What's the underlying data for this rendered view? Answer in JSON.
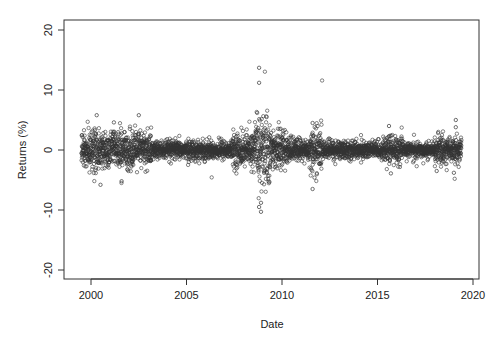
{
  "chart_data": {
    "type": "scatter",
    "title": "",
    "xlabel": "Date",
    "ylabel": "Returns (%)",
    "xlim": [
      1998.6,
      2020.3
    ],
    "ylim": [
      -22,
      22
    ],
    "x_ticks": [
      2000,
      2005,
      2010,
      2015,
      2020
    ],
    "x_tick_labels": [
      "2000",
      "2005",
      "2010",
      "2015",
      "2020"
    ],
    "y_ticks": [
      -20,
      -10,
      0,
      10,
      20
    ],
    "y_tick_labels": [
      "-20",
      "-10",
      "0",
      "10",
      "20"
    ],
    "grid": false,
    "legend": null,
    "marker": "open-circle",
    "marker_color": "#333333",
    "date_range": [
      1999.5,
      2019.4
    ],
    "volatility_regimes": [
      {
        "from": 1999.5,
        "to": 2003.2,
        "sd": 1.5
      },
      {
        "from": 2003.2,
        "to": 2007.4,
        "sd": 0.75
      },
      {
        "from": 2007.4,
        "to": 2008.6,
        "sd": 1.3
      },
      {
        "from": 2008.6,
        "to": 2009.4,
        "sd": 3.2
      },
      {
        "from": 2009.4,
        "to": 2010.3,
        "sd": 1.4
      },
      {
        "from": 2010.3,
        "to": 2011.5,
        "sd": 0.95
      },
      {
        "from": 2011.5,
        "to": 2012.1,
        "sd": 1.7
      },
      {
        "from": 2012.1,
        "to": 2015.5,
        "sd": 0.75
      },
      {
        "from": 2015.5,
        "to": 2016.3,
        "sd": 1.2
      },
      {
        "from": 2016.3,
        "to": 2018.0,
        "sd": 0.55
      },
      {
        "from": 2018.0,
        "to": 2019.4,
        "sd": 1.1
      }
    ],
    "notable_points": [
      {
        "x": 2008.8,
        "y": 13.7
      },
      {
        "x": 2008.8,
        "y": 11.2
      },
      {
        "x": 2008.9,
        "y": -10.3
      },
      {
        "x": 2008.8,
        "y": -9.5
      },
      {
        "x": 2008.9,
        "y": -8.8
      },
      {
        "x": 2000.3,
        "y": 5.8
      },
      {
        "x": 2000.5,
        "y": -5.8
      },
      {
        "x": 2001.6,
        "y": -5.2
      },
      {
        "x": 2002.5,
        "y": 5.8
      },
      {
        "x": 2001.2,
        "y": 4.6
      },
      {
        "x": 2011.6,
        "y": 4.5
      },
      {
        "x": 2011.6,
        "y": -6.5
      },
      {
        "x": 2011.7,
        "y": -4.6
      },
      {
        "x": 2015.6,
        "y": 4.0
      },
      {
        "x": 2015.7,
        "y": -3.9
      },
      {
        "x": 2018.1,
        "y": -3.5
      },
      {
        "x": 2019.1,
        "y": 5.0
      },
      {
        "x": 2019.1,
        "y": 3.8
      },
      {
        "x": 2019.0,
        "y": -3.8
      }
    ]
  }
}
